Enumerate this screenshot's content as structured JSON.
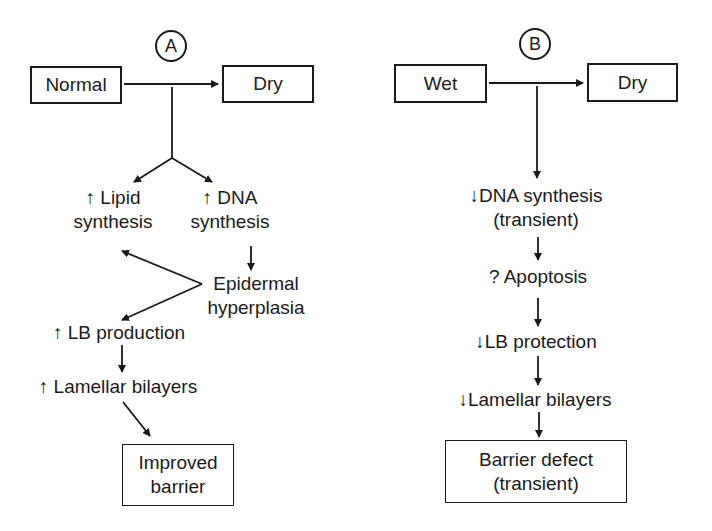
{
  "panel_a": {
    "badge": "A",
    "start": "Normal",
    "end": "Dry",
    "lipid": [
      "↑ Lipid",
      "synthesis"
    ],
    "dna": [
      "↑ DNA",
      "synthesis"
    ],
    "hyperplasia": [
      "Epidermal",
      "hyperplasia"
    ],
    "lb": "↑ LB production",
    "lamellar": "↑ Lamellar bilayers",
    "result": [
      "Improved",
      "barrier"
    ]
  },
  "panel_b": {
    "badge": "B",
    "start": "Wet",
    "end": "Dry",
    "dna": [
      "↓DNA synthesis",
      "(transient)"
    ],
    "apoptosis": "? Apoptosis",
    "lb": "↓LB protection",
    "lamellar": "↓Lamellar bilayers",
    "result": [
      "Barrier defect",
      "(transient)"
    ]
  }
}
